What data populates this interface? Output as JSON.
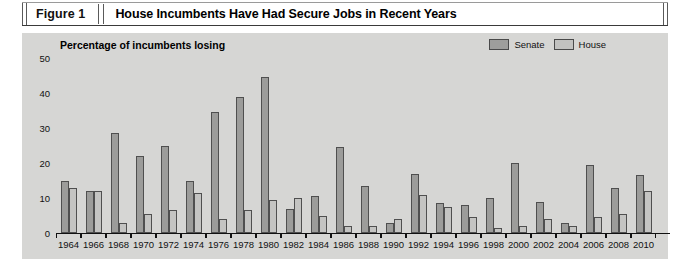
{
  "figure": {
    "number_label": "Figure 1",
    "title": "House Incumbents Have Had Secure Jobs in Recent Years"
  },
  "colors": {
    "panel_background": "#d6d6d4",
    "senate_bar": "#9c9c9a",
    "house_bar": "#c4c4c2",
    "axis": "#111111"
  },
  "chart_data": {
    "type": "bar",
    "title": "House Incumbents Have Had Secure Jobs in Recent Years",
    "ylabel": "Percentage of incumbents losing",
    "xlabel": "",
    "ylim": [
      0,
      50
    ],
    "yticks": [
      0,
      10,
      20,
      30,
      40,
      50
    ],
    "ytick_labels": [
      "0",
      "10",
      "20",
      "30",
      "40",
      "50"
    ],
    "grid": false,
    "legend_position": "top-right",
    "categories": [
      "1964",
      "1966",
      "1968",
      "1970",
      "1972",
      "1974",
      "1976",
      "1978",
      "1980",
      "1982",
      "1984",
      "1986",
      "1988",
      "1990",
      "1992",
      "1994",
      "1996",
      "1998",
      "2000",
      "2002",
      "2004",
      "2006",
      "2008",
      "2010"
    ],
    "series": [
      {
        "name": "Senate",
        "color": "#9c9c9a",
        "values": [
          15,
          12,
          28.5,
          22,
          25,
          15,
          34.5,
          39,
          44.5,
          7,
          10.5,
          24.5,
          13.5,
          3,
          17,
          8.5,
          8,
          10,
          20,
          9,
          3,
          19.5,
          13,
          16.5
        ]
      },
      {
        "name": "House",
        "color": "#c4c4c2",
        "values": [
          13,
          12,
          3,
          5.5,
          6.5,
          11.5,
          4,
          6.5,
          9.5,
          10,
          5,
          2,
          2,
          4,
          11,
          7.5,
          4.5,
          1.5,
          2,
          4,
          2,
          4.5,
          5.5,
          12
        ]
      }
    ]
  }
}
